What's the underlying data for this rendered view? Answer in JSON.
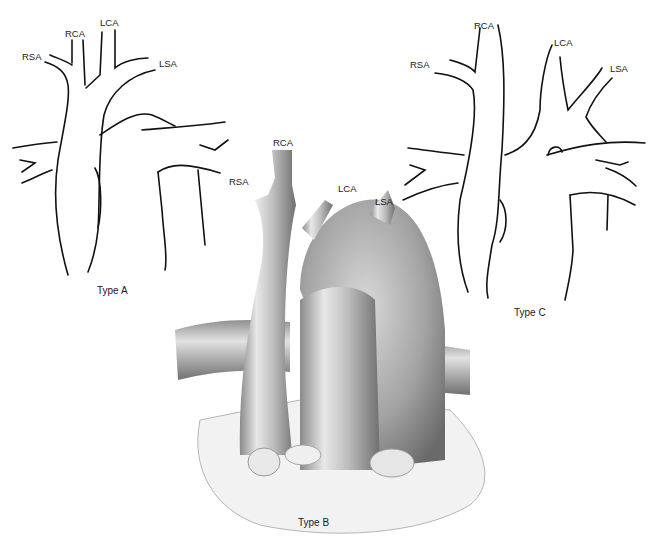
{
  "figure": {
    "panels": [
      {
        "id": "type-a",
        "caption": "Type A",
        "labels": {
          "rsa": "RSA",
          "rca": "RCA",
          "lca": "LCA",
          "lsa": "LSA"
        }
      },
      {
        "id": "type-b",
        "caption": "Type B",
        "labels": {
          "rca": "RCA",
          "rsa": "RSA",
          "lca": "LCA",
          "lsa": "LSA"
        }
      },
      {
        "id": "type-c",
        "caption": "Type C",
        "labels": {
          "rca": "RCA",
          "rsa": "RSA",
          "lca": "LCA",
          "lsa": "LSA"
        }
      }
    ]
  }
}
